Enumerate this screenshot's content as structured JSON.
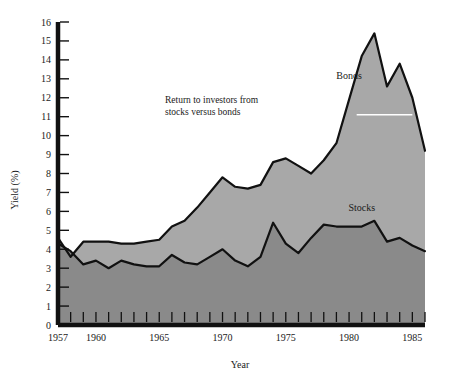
{
  "chart_data": {
    "type": "area",
    "title": "Return to investors from stocks versus bonds",
    "title_line1": "Return to investors from",
    "title_line2": "stocks versus bonds",
    "xlabel": "Year",
    "ylabel": "Yield (%)",
    "xlim": [
      1957,
      1986
    ],
    "ylim": [
      0,
      16
    ],
    "ytick_step": 1,
    "grid": false,
    "legend_position": "inline-annotation",
    "xticks_all": [
      1957,
      1958,
      1959,
      1960,
      1961,
      1962,
      1963,
      1964,
      1965,
      1966,
      1967,
      1968,
      1969,
      1970,
      1971,
      1972,
      1973,
      1974,
      1975,
      1976,
      1977,
      1978,
      1979,
      1980,
      1981,
      1982,
      1983,
      1984,
      1985,
      1986
    ],
    "xtick_labels": [
      "1957",
      "1960",
      "1965",
      "1970",
      "1975",
      "1980",
      "1985"
    ],
    "xtick_label_values": [
      1957,
      1960,
      1965,
      1970,
      1975,
      1980,
      1985
    ],
    "ytick_labels": [
      "0",
      "1",
      "2",
      "3",
      "4",
      "5",
      "6",
      "7",
      "8",
      "9",
      "10",
      "11",
      "12",
      "13",
      "14",
      "15",
      "16"
    ],
    "x": [
      1957,
      1958,
      1959,
      1960,
      1961,
      1962,
      1963,
      1964,
      1965,
      1966,
      1967,
      1968,
      1969,
      1970,
      1971,
      1972,
      1973,
      1974,
      1975,
      1976,
      1977,
      1978,
      1979,
      1980,
      1981,
      1982,
      1983,
      1984,
      1985,
      1986
    ],
    "series": [
      {
        "name": "Bonds",
        "color": "#a8a8a8",
        "label_x": 1980,
        "label_y": 13.0,
        "values": [
          4.6,
          3.6,
          4.4,
          4.4,
          4.4,
          4.3,
          4.3,
          4.4,
          4.5,
          5.2,
          5.5,
          6.2,
          7.0,
          7.8,
          7.3,
          7.2,
          7.4,
          8.6,
          8.8,
          8.4,
          8.0,
          8.7,
          9.6,
          11.9,
          14.2,
          15.4,
          12.6,
          13.8,
          12.0,
          9.2
        ]
      },
      {
        "name": "Stocks",
        "color": "#8a8a8a",
        "label_x": 1981,
        "label_y": 6.0,
        "values": [
          4.3,
          3.9,
          3.2,
          3.4,
          3.0,
          3.4,
          3.2,
          3.1,
          3.1,
          3.7,
          3.3,
          3.2,
          3.6,
          4.0,
          3.4,
          3.1,
          3.6,
          5.4,
          4.3,
          3.8,
          4.6,
          5.3,
          5.2,
          5.2,
          5.2,
          5.5,
          4.4,
          4.6,
          4.2,
          3.9
        ]
      }
    ]
  },
  "axis": {
    "y_title": "Yield (%)",
    "x_title": "Year"
  }
}
